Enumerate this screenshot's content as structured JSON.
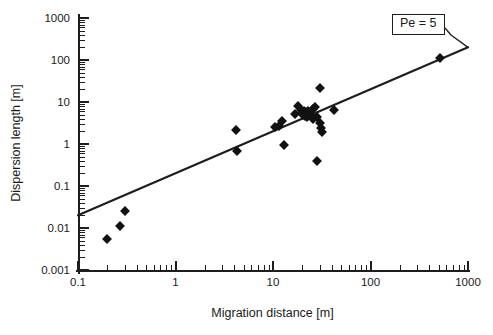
{
  "chart_data": {
    "type": "scatter",
    "title": "",
    "xlabel": "Migration distance [m]",
    "ylabel": "Dispersion length [m]",
    "xscale": "log",
    "yscale": "log",
    "xlim": [
      0.1,
      1000
    ],
    "ylim": [
      0.001,
      1000
    ],
    "grid": false,
    "legend_position": "none",
    "x_tick_labels": [
      "0.1",
      "1",
      "10",
      "100",
      "1000"
    ],
    "x_tick_values": [
      0.1,
      1,
      10,
      100,
      1000
    ],
    "y_tick_labels": [
      "0.001",
      "0.01",
      "0.1",
      "1",
      "10",
      "100",
      "1000"
    ],
    "y_tick_values": [
      0.001,
      0.01,
      0.1,
      1,
      10,
      100,
      1000
    ],
    "marker_style": "filled-diamond",
    "marker_color": "#111111",
    "line_color": "#1d1d1d",
    "annotations": [
      {
        "text": "Pe = 5",
        "x": 560,
        "y": 320,
        "leader_to_x": 1000,
        "leader_to_y": 200,
        "boxed": true
      }
    ],
    "series": [
      {
        "name": "Dispersion length measurements",
        "points": [
          [
            0.2,
            0.0055
          ],
          [
            0.27,
            0.011
          ],
          [
            0.3,
            0.026
          ],
          [
            4.2,
            2.1
          ],
          [
            4.3,
            0.68
          ],
          [
            10.5,
            2.6
          ],
          [
            11.5,
            2.7
          ],
          [
            12.5,
            3.6
          ],
          [
            13.0,
            0.95
          ],
          [
            17.0,
            5.2
          ],
          [
            18.0,
            8.0
          ],
          [
            19.5,
            6.4
          ],
          [
            20.0,
            5.5
          ],
          [
            20.5,
            5.0
          ],
          [
            21.0,
            6.0
          ],
          [
            21.5,
            4.6
          ],
          [
            22.0,
            5.8
          ],
          [
            22.5,
            4.4
          ],
          [
            23.0,
            6.2
          ],
          [
            24.0,
            5.0
          ],
          [
            25.5,
            4.0
          ],
          [
            26.0,
            6.8
          ],
          [
            27.0,
            7.4
          ],
          [
            28.0,
            4.3
          ],
          [
            30.0,
            22.0
          ],
          [
            30.5,
            3.1
          ],
          [
            31.0,
            2.4
          ],
          [
            31.5,
            1.9
          ],
          [
            28.5,
            0.4
          ],
          [
            42.0,
            6.5
          ],
          [
            520.0,
            110.0
          ]
        ]
      }
    ],
    "reference_line": {
      "label": "Pe = 5",
      "slope_loglog": 1,
      "relation": "dispersion length = migration distance / 5",
      "x_start": 0.1,
      "y_start": 0.02,
      "x_end": 1000,
      "y_end": 200
    }
  },
  "x_minor_ticks": [
    0.2,
    0.3,
    0.4,
    0.5,
    0.6,
    0.7,
    0.8,
    0.9,
    2,
    3,
    4,
    5,
    6,
    7,
    8,
    9,
    20,
    30,
    40,
    50,
    60,
    70,
    80,
    90,
    200,
    300,
    400,
    500,
    600,
    700,
    800,
    900
  ],
  "y_minor_ticks": [
    0.002,
    0.003,
    0.004,
    0.005,
    0.006,
    0.007,
    0.008,
    0.009,
    0.02,
    0.03,
    0.04,
    0.05,
    0.06,
    0.07,
    0.08,
    0.09,
    0.2,
    0.3,
    0.4,
    0.5,
    0.6,
    0.7,
    0.8,
    0.9,
    2,
    3,
    4,
    5,
    6,
    7,
    8,
    9,
    20,
    30,
    40,
    50,
    60,
    70,
    80,
    90,
    200,
    300,
    400,
    500,
    600,
    700,
    800,
    900
  ]
}
